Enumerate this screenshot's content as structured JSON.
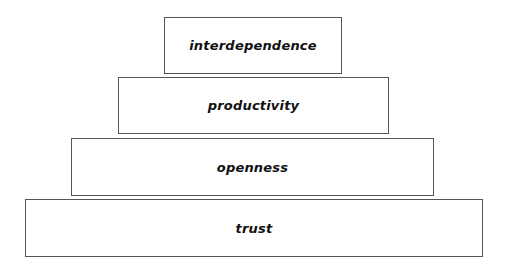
{
  "diagram": {
    "type": "pyramid",
    "tiers": [
      {
        "label": "interdependence"
      },
      {
        "label": "productivity"
      },
      {
        "label": "openness"
      },
      {
        "label": "trust"
      }
    ],
    "colors": {
      "border": "#555555",
      "fill": "#ffffff",
      "text": "#111111"
    }
  }
}
